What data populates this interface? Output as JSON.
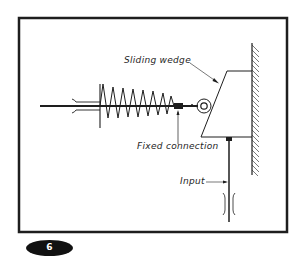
{
  "figure": {
    "number": "6",
    "type": "mechanical schematic"
  },
  "labels": {
    "sliding_wedge": "Sliding wedge",
    "fixed_connection": "Fixed connection",
    "input": "Input"
  },
  "components": [
    {
      "name": "frame",
      "description": "Rectangular border around diagram"
    },
    {
      "name": "follower-rod",
      "description": "Horizontal rod passing through guide"
    },
    {
      "name": "guide-bracket",
      "description": "Left guide bushing for rod"
    },
    {
      "name": "compression-spring",
      "description": "Coil spring between guide and fixed connection"
    },
    {
      "name": "fixed-connection",
      "description": "Block fixing spring to rod"
    },
    {
      "name": "roller",
      "description": "Roller follower contacting wedge"
    },
    {
      "name": "sliding-wedge",
      "description": "Trapezoidal wedge sliding along wall"
    },
    {
      "name": "wall",
      "description": "Fixed hatched vertical surface"
    },
    {
      "name": "input-rod",
      "description": "Vertical input rod driving wedge"
    },
    {
      "name": "input-guide",
      "description": "Guide bushing for input rod"
    }
  ],
  "colors": {
    "ink": "#1e1e1e",
    "background": "#ffffff",
    "badge": "#111111"
  }
}
